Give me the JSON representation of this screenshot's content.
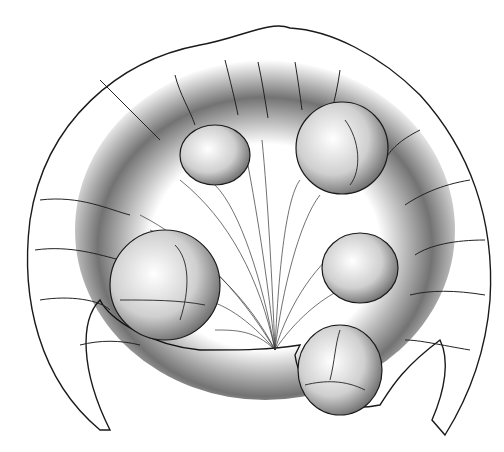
{
  "illustration": {
    "subject": "pen-and-ink drawing of a coiled organ/fruiting structure with five round bodies attached by radiating fibers",
    "background_color": "#ffffff",
    "ink_color": "#1a1a1a",
    "bodies": [
      {
        "name": "top-left-body",
        "cx": 215,
        "cy": 155,
        "rx": 35,
        "ry": 30
      },
      {
        "name": "top-right-body",
        "cx": 342,
        "cy": 148,
        "rx": 46,
        "ry": 46
      },
      {
        "name": "left-body",
        "cx": 165,
        "cy": 285,
        "rx": 55,
        "ry": 55
      },
      {
        "name": "right-body",
        "cx": 360,
        "cy": 268,
        "rx": 38,
        "ry": 35
      },
      {
        "name": "bottom-right-body",
        "cx": 340,
        "cy": 370,
        "rx": 42,
        "ry": 45
      }
    ]
  }
}
